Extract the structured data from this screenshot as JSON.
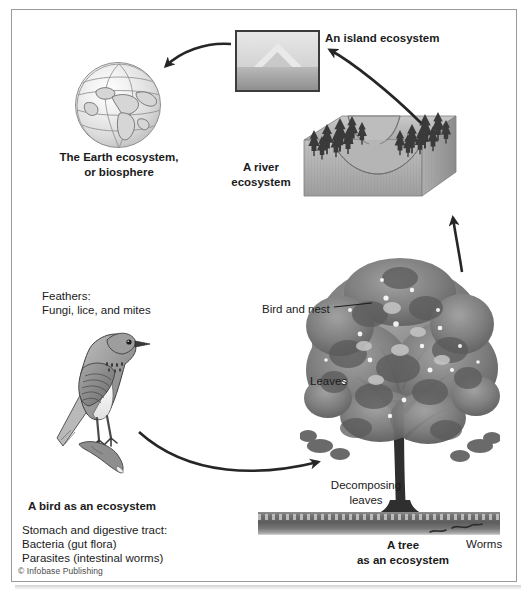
{
  "figure": {
    "credit": "© Infobase Publishing"
  },
  "labels": {
    "earth": "The Earth ecosystem,\nor biosphere",
    "island": "An island ecosystem",
    "river": "A river\necosystem",
    "feathers_title": "Feathers:",
    "feathers_detail": "Fungi, lice, and mites",
    "bird_title": "A bird as an ecosystem",
    "bird_detail_1": "Stomach and digestive tract:",
    "bird_detail_2": "Bacteria (gut flora)",
    "bird_detail_3": "Parasites (intestinal worms)",
    "bird_and_nest": "Bird and nest",
    "leaves": "Leaves",
    "decomposing_leaves": "Decomposing\nleaves",
    "worms": "Worms",
    "tree_title": "A tree\nas an ecosystem"
  },
  "colors": {
    "ink": "#1b1b1b",
    "frame": "#9a9a9a",
    "arrow": "#262626",
    "soil_dark": "#5d5d5d",
    "foliage": "#6f6f6f"
  }
}
